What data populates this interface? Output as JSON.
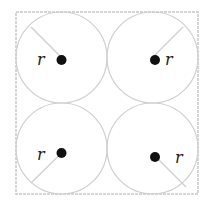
{
  "diagram": {
    "colors": {
      "outline": "#c8c8c8",
      "dot": "#111111",
      "label": "#222222"
    },
    "circles": [
      {
        "position": "top-left",
        "radius_label": "r"
      },
      {
        "position": "top-right",
        "radius_label": "r"
      },
      {
        "position": "bottom-left",
        "radius_label": "r"
      },
      {
        "position": "bottom-right",
        "radius_label": "r"
      }
    ]
  }
}
